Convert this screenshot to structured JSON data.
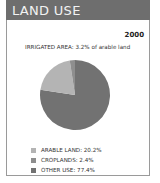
{
  "header": {
    "title": "LAND USE"
  },
  "chart_data": {
    "type": "pie",
    "title": "LAND USE",
    "year_label": "2000",
    "subtitle": "IRRIGATED AREA: 3.2% of arable land",
    "legend_position": "bottom",
    "slices": [
      {
        "label": "OTHER USE",
        "value": 77.4,
        "color": "#727272",
        "legend_text": "OTHER USE: 77.4%"
      },
      {
        "label": "ARABLE LAND",
        "value": 20.2,
        "color": "#b4b4b4",
        "legend_text": "ARABLE LAND: 20.2%"
      },
      {
        "label": "CROPLANDS",
        "value": 2.4,
        "color": "#8e8e8e",
        "legend_text": "CROPLANDS: 2.4%"
      }
    ],
    "legend_order": [
      "ARABLE LAND",
      "CROPLANDS",
      "OTHER USE"
    ]
  }
}
